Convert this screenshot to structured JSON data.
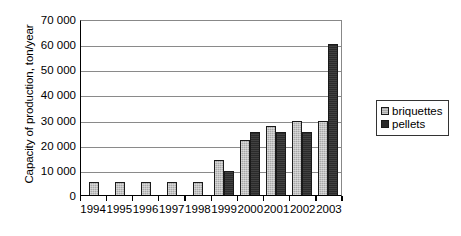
{
  "chart_data": {
    "type": "bar",
    "title": "",
    "subtitle": "",
    "xlabel": "",
    "ylabel": "Capacity of production, ton/year",
    "categories": [
      "1994",
      "1995",
      "1996",
      "1997",
      "1998",
      "1999",
      "2000",
      "2001",
      "2002",
      "2003"
    ],
    "series": [
      {
        "name": "briquettes",
        "color": "#a8a8a8",
        "values": [
          5000,
          5000,
          5000,
          5000,
          5000,
          14000,
          22000,
          27500,
          29500,
          29500
        ]
      },
      {
        "name": "pellets",
        "color": "#2b2b2b",
        "values": [
          0,
          0,
          0,
          0,
          0,
          9500,
          25000,
          25000,
          25000,
          60000
        ]
      }
    ],
    "ylim": [
      0,
      70000
    ],
    "ytick_values": [
      0,
      10000,
      20000,
      30000,
      40000,
      50000,
      60000,
      70000
    ],
    "ytick_labels": [
      "0",
      "10 000",
      "20 000",
      "30 000",
      "40 000",
      "50 000",
      "60 000",
      "70 000"
    ],
    "grid": true,
    "grid_axis": "y",
    "legend_position": "right",
    "legend_entries": [
      "briquettes",
      "pellets"
    ]
  }
}
